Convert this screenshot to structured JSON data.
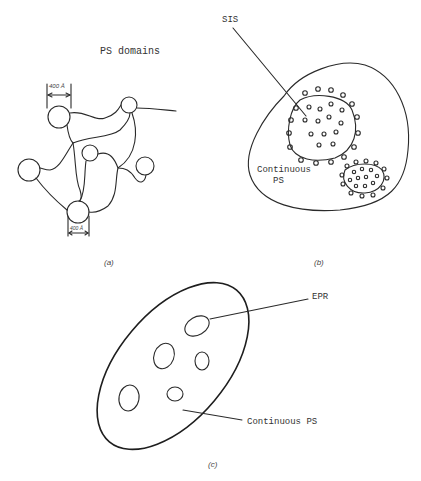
{
  "figure": {
    "panel_a": {
      "title": "PS domains",
      "scale_top": "400 Å",
      "scale_bottom": "400 Å",
      "caption": "(a)"
    },
    "panel_b": {
      "label_sis": "SIS",
      "label_continuous_line1": "Continuous",
      "label_continuous_line2": "PS",
      "caption": "(b)"
    },
    "panel_c": {
      "label_epr": "EPR",
      "label_continuous": "Continuous PS",
      "caption": "(c)"
    }
  }
}
